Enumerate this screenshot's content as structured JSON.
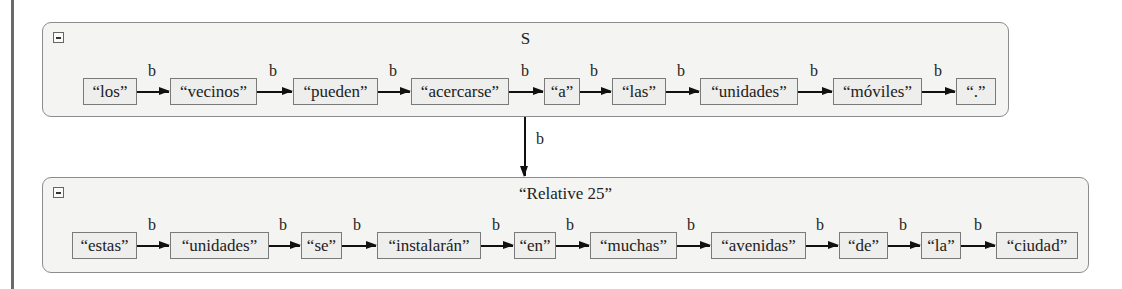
{
  "diagram": {
    "containers": [
      {
        "id": "S",
        "title": "S",
        "collapse_icon": "minus-box-icon",
        "nodes": [
          "“los”",
          "“vecinos”",
          "“pueden”",
          "“acercarse”",
          "“a”",
          "“las”",
          "“unidades”",
          "“móviles”",
          "“.”"
        ],
        "edge_label": "b"
      },
      {
        "id": "relative-25",
        "title": "“Relative 25”",
        "collapse_icon": "minus-box-icon",
        "nodes": [
          "“estas”",
          "“unidades”",
          "“se”",
          "“instalarán”",
          "“en”",
          "“muchas”",
          "“avenidas”",
          "“de”",
          "“la”",
          "“ciudad”"
        ],
        "edge_label": "b"
      }
    ],
    "link": {
      "from": "S",
      "to": "relative-25",
      "label": "b"
    },
    "colors": {
      "container_fill": "#f4f4f2",
      "border": "#8c8c8c",
      "node_fill": "#eeeeec",
      "arrow": "#111111"
    }
  }
}
